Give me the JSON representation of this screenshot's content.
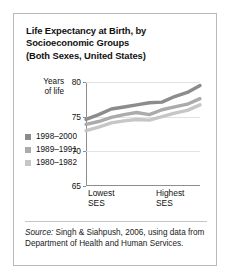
{
  "title": {
    "line1": "Life Expectancy at Birth, by",
    "line2": "Socioeconomic Groups",
    "line3": "(Both Sexes, United States)"
  },
  "axis_title": {
    "line1": "Years",
    "line2": "of life"
  },
  "xaxis": {
    "left_line1": "Lowest",
    "left_line2": "SES",
    "right_line1": "Highest",
    "right_line2": "SES"
  },
  "yticks": [
    {
      "label": "80",
      "value": 80
    },
    {
      "label": "75",
      "value": 75
    },
    {
      "label": "70",
      "value": 70
    },
    {
      "label": "65",
      "value": 65
    }
  ],
  "legend": [
    {
      "label": "1998–2000",
      "color": "#8c8c8c"
    },
    {
      "label": "1989–1991",
      "color": "#ababab"
    },
    {
      "label": "1980–1982",
      "color": "#c6c6c6"
    }
  ],
  "source": {
    "prefix": "Source:",
    "text": " Singh & Siahpush, 2006, using data from Department of Health and Human Services."
  },
  "chart_data": {
    "type": "line",
    "title": "Life Expectancy at Birth, by Socioeconomic Groups (Both Sexes, United States)",
    "xlabel": "Socioeconomic status (SES) decile, lowest to highest",
    "ylabel": "Years of life",
    "ylim": [
      65,
      80
    ],
    "yticks": [
      65,
      70,
      75,
      80
    ],
    "grid": true,
    "legend_position": "bottom-left",
    "x": [
      1,
      2,
      3,
      4,
      5,
      6,
      7,
      8,
      9,
      10
    ],
    "xtick_labels": [
      "Lowest SES",
      "",
      "",
      "",
      "",
      "",
      "",
      "",
      "",
      "Highest SES"
    ],
    "series": [
      {
        "name": "1998–2000",
        "color": "#8c8c8c",
        "values": [
          74.6,
          75.3,
          76.1,
          76.4,
          76.7,
          77.0,
          77.1,
          77.9,
          78.5,
          79.5
        ]
      },
      {
        "name": "1989–1991",
        "color": "#ababab",
        "values": [
          73.9,
          74.3,
          74.9,
          75.3,
          75.6,
          75.3,
          76.0,
          76.4,
          76.8,
          77.6
        ]
      },
      {
        "name": "1980–1982",
        "color": "#c6c6c6",
        "values": [
          73.0,
          73.5,
          74.1,
          74.4,
          74.6,
          74.5,
          75.0,
          75.5,
          75.9,
          76.7
        ]
      }
    ]
  }
}
